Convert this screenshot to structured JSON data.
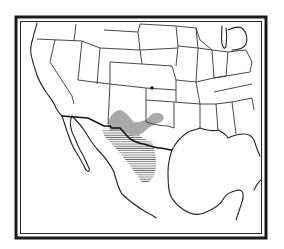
{
  "map": {
    "type": "species-range-map",
    "region": "Southern United States and Mexico",
    "style": "black-and-white line map",
    "colors": {
      "background": "#ffffff",
      "lines": "#222222",
      "range_stipple": "#9a9a9a",
      "range_hatch": "#777777",
      "marker": "#111111"
    },
    "features": {
      "frame": "double-line border",
      "state_boundaries": "US state outlines",
      "range_primary": "hatched area: northern Mexico (Chihuahua/Coahuila) into southwest Texas",
      "range_secondary": "stippled area: southern New Mexico and west Texas",
      "isolated_record": "single dot in southwestern Kansas / Oklahoma panhandle"
    },
    "labels": []
  }
}
